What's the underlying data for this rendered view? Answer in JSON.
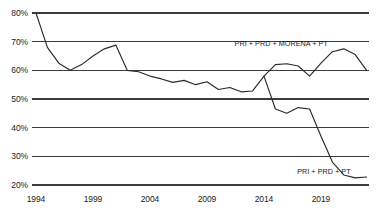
{
  "chart_data": {
    "type": "line",
    "title": "",
    "subtitle": "",
    "xlabel": "",
    "ylabel": "",
    "xlim": [
      1994,
      2023
    ],
    "ylim": [
      20,
      80
    ],
    "grid": true,
    "legend_position": "inline-annotation",
    "y_ticks": [
      "20%",
      "30%",
      "40%",
      "50%",
      "60%",
      "70%",
      "80%"
    ],
    "y_tick_values": [
      20,
      30,
      40,
      50,
      60,
      70,
      80
    ],
    "x_ticks": [
      "1994",
      "1999",
      "2004",
      "2009",
      "2014",
      "2019"
    ],
    "x_tick_values": [
      1994,
      1999,
      2004,
      2009,
      2014,
      2019
    ],
    "series": [
      {
        "name": "PRI + PRD + MORENA + PT",
        "annotation": "PRI + PRD + MORENA + PT",
        "annotation_x": 2019.6,
        "annotation_y": 68.5,
        "x": [
          1994,
          1995,
          1996,
          1997,
          1998,
          1999,
          2000,
          2001,
          2002,
          2003,
          2004,
          2005,
          2006,
          2007,
          2008,
          2009,
          2010,
          2011,
          2012,
          2013,
          2014,
          2015,
          2016,
          2017,
          2018,
          2019,
          2020,
          2021,
          2022,
          2023
        ],
        "values": [
          80.0,
          68.0,
          62.5,
          60.0,
          62.0,
          65.0,
          67.5,
          68.8,
          60.0,
          59.5,
          58.0,
          57.0,
          55.8,
          56.5,
          55.0,
          56.0,
          53.3,
          54.0,
          52.5,
          52.8,
          58.0,
          62.0,
          62.3,
          61.5,
          58.0,
          62.5,
          66.5,
          67.5,
          65.5,
          60.0
        ]
      },
      {
        "name": "PRI + PRD + PT",
        "annotation": "PRI + PRD + PT",
        "annotation_x": 2021.6,
        "annotation_y": 24.0,
        "x": [
          2014,
          2015,
          2016,
          2017,
          2018,
          2019,
          2020,
          2021,
          2022,
          2023
        ],
        "values": [
          58.0,
          46.5,
          45.0,
          47.0,
          46.5,
          37.0,
          28.0,
          23.5,
          22.5,
          22.8
        ]
      }
    ]
  }
}
